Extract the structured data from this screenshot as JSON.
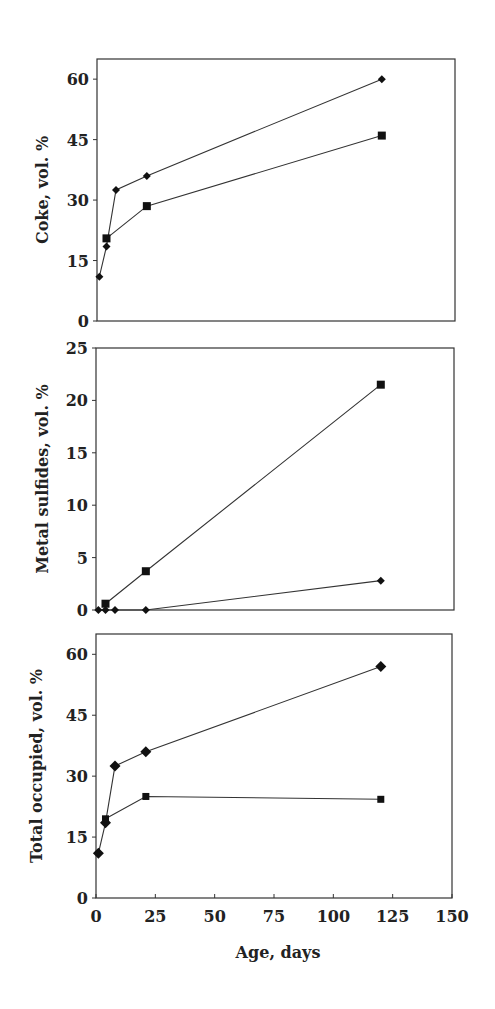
{
  "chart_data": [
    {
      "type": "line",
      "title": "",
      "xlabel": "",
      "ylabel": "Coke, vol. %",
      "xlim": [
        0,
        150
      ],
      "ylim": [
        0,
        65
      ],
      "yticks": [
        0,
        15,
        30,
        45,
        60
      ],
      "xticks": [],
      "grid": false,
      "legend": "none",
      "series": [
        {
          "name": "diamond series",
          "marker": "diamond",
          "x": [
            1,
            4,
            8,
            21,
            120
          ],
          "values": [
            11,
            18.5,
            32.5,
            36,
            60
          ]
        },
        {
          "name": "square series",
          "marker": "square",
          "x": [
            4,
            21,
            120
          ],
          "values": [
            20.5,
            28.5,
            46
          ]
        }
      ]
    },
    {
      "type": "line",
      "title": "",
      "xlabel": "",
      "ylabel": "Metal sulfides, vol. %",
      "xlim": [
        0,
        150
      ],
      "ylim": [
        0,
        25
      ],
      "yticks": [
        0,
        5,
        10,
        15,
        20,
        25
      ],
      "xticks": [],
      "grid": false,
      "legend": "none",
      "series": [
        {
          "name": "diamond series",
          "marker": "diamond",
          "x": [
            1,
            4,
            8,
            21,
            120
          ],
          "values": [
            0,
            0,
            0,
            0,
            2.8
          ]
        },
        {
          "name": "square series",
          "marker": "square",
          "x": [
            4,
            21,
            120
          ],
          "values": [
            0.6,
            3.7,
            21.5
          ]
        }
      ]
    },
    {
      "type": "line",
      "title": "",
      "xlabel": "Age, days",
      "ylabel": "Total occupied, vol. %",
      "xlim": [
        0,
        150
      ],
      "ylim": [
        0,
        65
      ],
      "yticks": [
        0,
        15,
        30,
        45,
        60
      ],
      "xticks": [
        0,
        25,
        50,
        75,
        100,
        125,
        150
      ],
      "grid": false,
      "legend": "none",
      "series": [
        {
          "name": "diamond series",
          "marker": "diamond",
          "x": [
            1,
            4,
            8,
            21,
            120
          ],
          "values": [
            11,
            18.5,
            32.5,
            36,
            57
          ]
        },
        {
          "name": "square series",
          "marker": "square",
          "x": [
            4,
            21,
            120
          ],
          "values": [
            19.5,
            25,
            24.3
          ]
        }
      ]
    }
  ],
  "panels": [
    {
      "ylabel": "Coke, vol. %",
      "yticks": [
        "0",
        "15",
        "30",
        "45",
        "60"
      ]
    },
    {
      "ylabel": "Metal sulfides, vol. %",
      "yticks": [
        "0",
        "5",
        "10",
        "15",
        "20",
        "25"
      ]
    },
    {
      "ylabel": "Total occupied, vol. %",
      "yticks": [
        "0",
        "15",
        "30",
        "45",
        "60"
      ]
    }
  ],
  "x_axis": {
    "label": "Age, days",
    "ticks": [
      "0",
      "25",
      "50",
      "75",
      "100",
      "125",
      "150"
    ]
  },
  "colors": {
    "line": "#333333",
    "marker": "#111111",
    "axis": "#333333"
  }
}
